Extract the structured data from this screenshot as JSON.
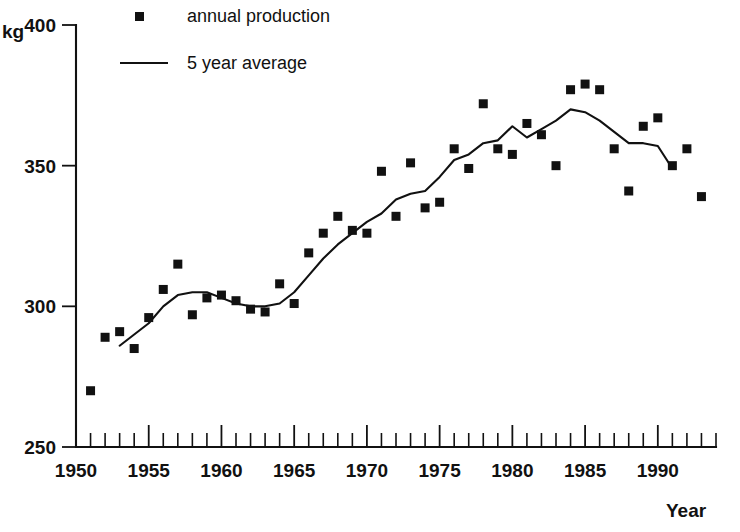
{
  "chart_data": {
    "type": "scatter",
    "title": "",
    "subtitle": "",
    "xlabel": "Year",
    "ylabel": "kg",
    "y_unit_label": "kg",
    "xlim": [
      1950,
      1994
    ],
    "ylim": [
      250,
      400
    ],
    "grid": false,
    "legend_position": "top-center",
    "y_ticks": [
      250,
      300,
      350,
      400
    ],
    "y_tick_labels": [
      "250",
      "300",
      "350",
      "400"
    ],
    "x_ticks": [
      1950,
      1955,
      1960,
      1965,
      1970,
      1975,
      1980,
      1985,
      1990
    ],
    "x_tick_labels": [
      "1950",
      "1955",
      "1960",
      "1965",
      "1970",
      "1975",
      "1980",
      "1985",
      "1990"
    ],
    "x_minor_tick_step": 1,
    "series": [
      {
        "name": "annual production",
        "type": "scatter",
        "marker": "square",
        "color": "#111111",
        "x": [
          1951,
          1952,
          1953,
          1954,
          1955,
          1956,
          1957,
          1958,
          1959,
          1960,
          1961,
          1962,
          1963,
          1964,
          1965,
          1966,
          1967,
          1968,
          1969,
          1970,
          1971,
          1972,
          1973,
          1974,
          1975,
          1976,
          1977,
          1978,
          1979,
          1980,
          1981,
          1982,
          1983,
          1984,
          1985,
          1986,
          1987,
          1988,
          1989,
          1990,
          1991,
          1992,
          1993
        ],
        "y": [
          270,
          289,
          291,
          285,
          296,
          306,
          315,
          297,
          303,
          304,
          302,
          299,
          298,
          308,
          301,
          319,
          326,
          332,
          327,
          326,
          348,
          332,
          351,
          335,
          337,
          356,
          349,
          372,
          356,
          354,
          365,
          361,
          350,
          377,
          379,
          377,
          356,
          341,
          364,
          367,
          350,
          356,
          339
        ]
      },
      {
        "name": "5 year average",
        "type": "line",
        "color": "#111111",
        "x": [
          1953,
          1954,
          1955,
          1956,
          1957,
          1958,
          1959,
          1960,
          1961,
          1962,
          1963,
          1964,
          1965,
          1966,
          1967,
          1968,
          1969,
          1970,
          1971,
          1972,
          1973,
          1974,
          1975,
          1976,
          1977,
          1978,
          1979,
          1980,
          1981,
          1982,
          1983,
          1984,
          1985,
          1986,
          1987,
          1988,
          1989,
          1990,
          1991
        ],
        "y": [
          286,
          290,
          294,
          300,
          304,
          305,
          305,
          303,
          301,
          300,
          300,
          301,
          305,
          311,
          317,
          322,
          326,
          330,
          333,
          338,
          340,
          341,
          346,
          352,
          354,
          358,
          359,
          364,
          360,
          363,
          366,
          370,
          369,
          366,
          362,
          358,
          358,
          357,
          349
        ]
      }
    ]
  },
  "legend": {
    "items": [
      {
        "label": "annual production",
        "marker": "square"
      },
      {
        "label": "5 year average",
        "marker": "line"
      }
    ]
  },
  "axes": {
    "y_unit": "kg",
    "x_name": "Year"
  }
}
